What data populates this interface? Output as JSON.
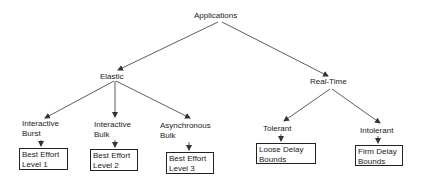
{
  "diagram": {
    "root": {
      "label": "Applications"
    },
    "categories": [
      {
        "label": "Elastic"
      },
      {
        "label": "Real-Time"
      }
    ],
    "elastic_children": [
      {
        "line1": "Interactive",
        "line2": "Burst",
        "box": {
          "line1": "Best Effort",
          "line2": "Level 1"
        }
      },
      {
        "line1": "Interactive",
        "line2": "Bulk",
        "box": {
          "line1": "Best Effort",
          "line2": "Level 2"
        }
      },
      {
        "line1": "Asynchronous",
        "line2": "Bulk",
        "box": {
          "line1": "Best Effort",
          "line2": "Level 3"
        }
      }
    ],
    "realtime_children": [
      {
        "line1": "Tolerant",
        "box": {
          "line1": "Loose Delay",
          "line2": "Bounds"
        }
      },
      {
        "line1": "Intolerant",
        "box": {
          "line1": "Firm Delay",
          "line2": "Bounds"
        }
      }
    ]
  },
  "colors": {
    "line": "#333333",
    "text": "#1a1a1a",
    "background": "#ffffff"
  }
}
